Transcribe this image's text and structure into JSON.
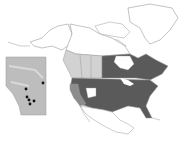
{
  "map": {
    "title": "",
    "subject": "Species distribution map of North America",
    "colors": {
      "background": "#ffffff",
      "outline": "#9a9a9a",
      "range_dark": "#5a5a5a",
      "range_light": "#d2d2d2",
      "range_medium": "#8c8c8c",
      "unshaded": "#ffffff",
      "inset_fill": "#bdbdbd",
      "record_dot": "#111111"
    },
    "regions": [
      {
        "name": "Eastern & central United States",
        "shade": "range_dark"
      },
      {
        "name": "Eastern Canada (Manitoba, Ontario, Quebec, Maritimes)",
        "shade": "range_dark"
      },
      {
        "name": "British Columbia",
        "shade": "range_light"
      },
      {
        "name": "Alberta",
        "shade": "range_light"
      },
      {
        "name": "Saskatchewan",
        "shade": "range_light"
      },
      {
        "name": "California / Oregon",
        "shade": "range_medium"
      },
      {
        "name": "Nevada / Utah",
        "shade": "unshaded"
      },
      {
        "name": "Alaska, Yukon, NWT, Nunavut, Greenland, Mexico",
        "shade": "unshaded"
      }
    ],
    "inset": {
      "name": "Alberta inset",
      "records": [
        {
          "x": 21,
          "y": 33
        },
        {
          "x": 38,
          "y": 27
        },
        {
          "x": 22,
          "y": 41
        },
        {
          "x": 24,
          "y": 44
        },
        {
          "x": 29,
          "y": 45
        },
        {
          "x": 25,
          "y": 48
        }
      ]
    }
  }
}
